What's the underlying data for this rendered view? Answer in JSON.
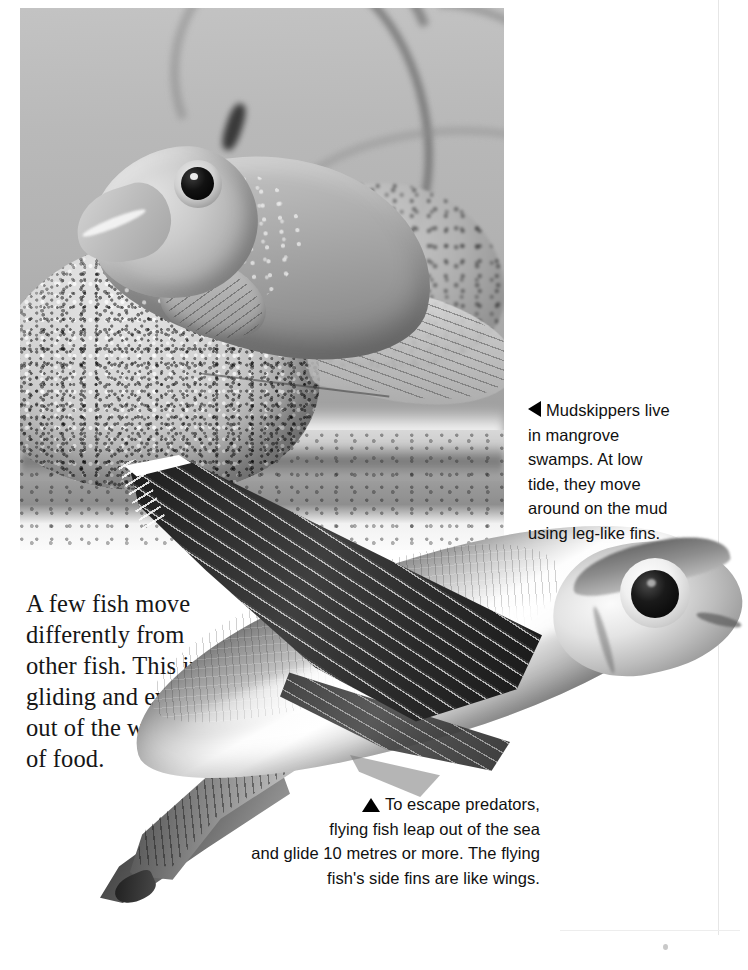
{
  "page": {
    "background_color": "#ffffff",
    "accent_color": "#000000"
  },
  "body_text": {
    "paragraph": "A few fish move\ndifferently from\nother fish. This includes\ngliding and even climbing\nout of the water in search\nof food."
  },
  "captions": [
    {
      "id": "mudskipper-caption",
      "marker_icon": "triangle-left-icon",
      "text": "Mudskippers live\nin mangrove\nswamps. At low\ntide, they move\naround on the mud\nusing leg-like fins.",
      "align": "left"
    },
    {
      "id": "flyingfish-caption",
      "marker_icon": "triangle-up-icon",
      "text": "To escape predators,\nflying fish leap out of the sea\nand glide 10 metres or more. The flying\nfish's side fins are like wings.",
      "align": "right"
    }
  ],
  "images": [
    {
      "id": "mudskipper-photo",
      "subject": "mudskipper fish resting on a speckled granite rock",
      "style": "black and white photograph",
      "background": "blurred mangrove roots"
    },
    {
      "id": "flyingfish-cutout",
      "subject": "flying fish with large outspread wing-like pectoral fin",
      "style": "black and white cut-out photograph"
    }
  ]
}
